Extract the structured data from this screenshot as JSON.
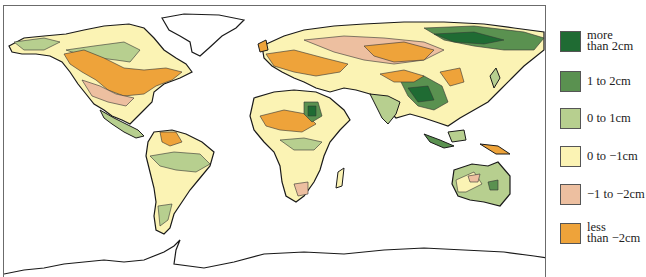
{
  "map": {
    "type": "choropleth-world-map",
    "regions_colored": "land areas shaded by change class",
    "border_color": "#6b6b6b",
    "coastline_color": "#1a1a1a"
  },
  "legend": {
    "items": [
      {
        "label": "more\nthan 2cm",
        "color": "#1f6b33"
      },
      {
        "label": "1 to 2cm",
        "color": "#5a9150"
      },
      {
        "label": "0 to 1cm",
        "color": "#b7cf8f"
      },
      {
        "label": "0 to −1cm",
        "color": "#fbf3b4"
      },
      {
        "label": "−1 to −2cm",
        "color": "#edbfa0"
      },
      {
        "label": "less\nthan −2cm",
        "color": "#eea33a"
      }
    ]
  }
}
